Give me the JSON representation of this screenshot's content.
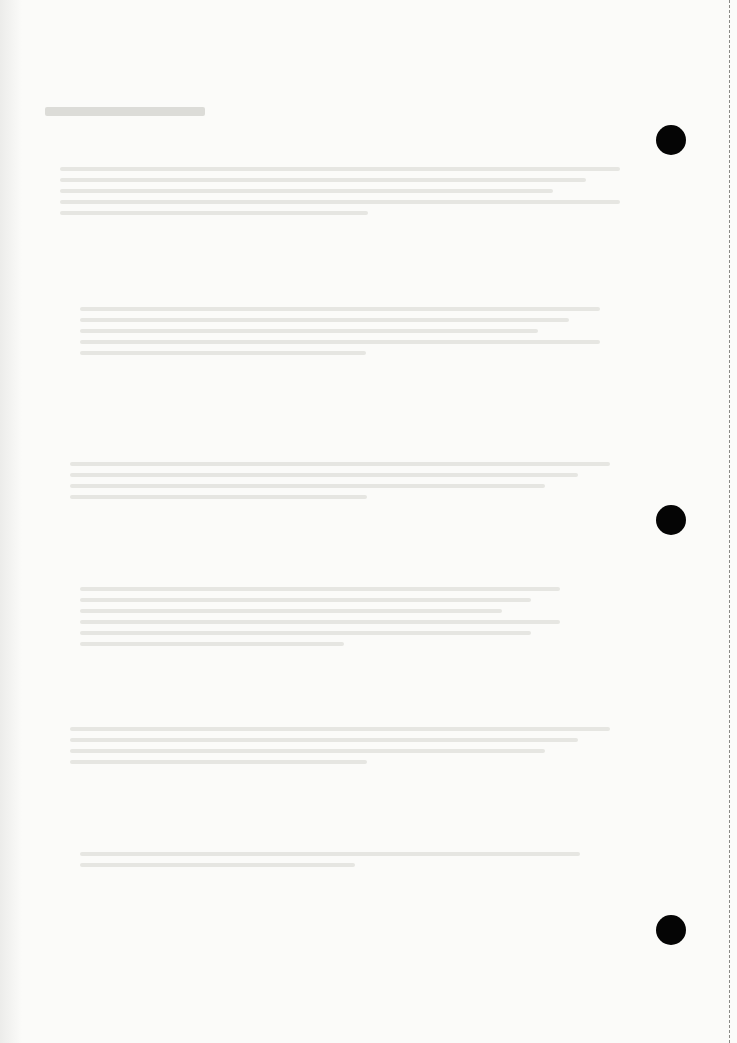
{
  "page": {
    "kind": "scanned printed page",
    "legibility": "text too faded to transcribe",
    "background_color": "#fbfbf9"
  },
  "binding": {
    "punch_holes": [
      {
        "x": 656,
        "y": 125
      },
      {
        "x": 656,
        "y": 505
      },
      {
        "x": 656,
        "y": 915
      }
    ],
    "punch_hole_color": "#050505",
    "perforation": {
      "x": 729,
      "style": "dashed",
      "color": "#8a8a86"
    }
  },
  "text_regions": [
    {
      "role": "heading",
      "x": 45,
      "y": 100,
      "width": 160,
      "lines": 1,
      "text": ""
    },
    {
      "role": "paragraph",
      "x": 60,
      "y": 160,
      "width": 560,
      "lines": 5,
      "text": ""
    },
    {
      "role": "paragraph",
      "x": 80,
      "y": 300,
      "width": 520,
      "lines": 5,
      "text": ""
    },
    {
      "role": "paragraph",
      "x": 70,
      "y": 455,
      "width": 540,
      "lines": 4,
      "text": ""
    },
    {
      "role": "paragraph",
      "x": 80,
      "y": 580,
      "width": 480,
      "lines": 6,
      "text": ""
    },
    {
      "role": "paragraph",
      "x": 70,
      "y": 720,
      "width": 540,
      "lines": 4,
      "text": ""
    },
    {
      "role": "paragraph",
      "x": 80,
      "y": 845,
      "width": 500,
      "lines": 2,
      "text": ""
    }
  ]
}
